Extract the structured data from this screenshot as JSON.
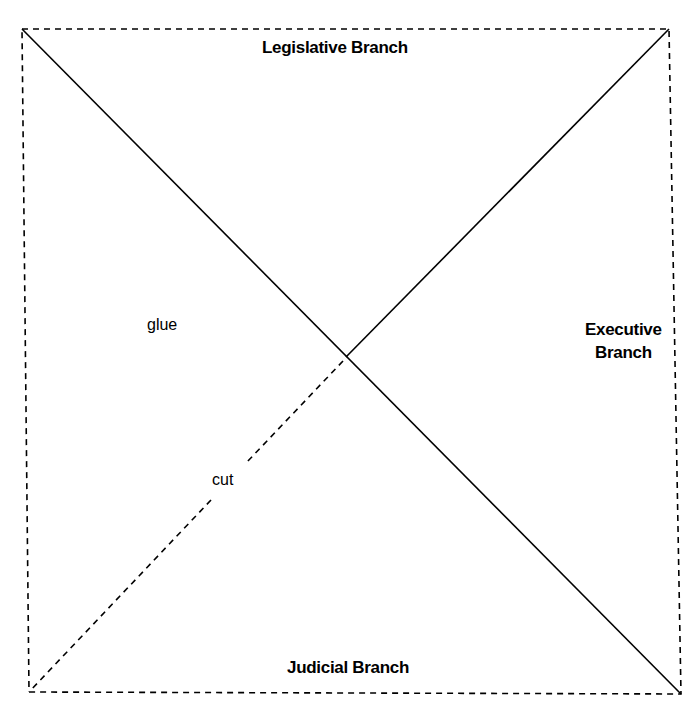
{
  "diagram": {
    "type": "cut-and-fold template",
    "labels": {
      "top": "Legislative Branch",
      "right_line1": "Executive",
      "right_line2": "Branch",
      "bottom": "Judicial Branch",
      "glue": "glue",
      "cut": "cut"
    },
    "square_corners": {
      "top_left": [
        22,
        29
      ],
      "top_right": [
        669,
        29
      ],
      "bottom_right": [
        681,
        694
      ],
      "bottom_left": [
        29,
        692
      ]
    },
    "center": [
      346,
      357
    ],
    "lines": {
      "border": "dashed",
      "diagonal_tl_to_br": "solid",
      "center_to_tr": "solid",
      "center_to_bl": "dashed (cut line)"
    },
    "colors": {
      "line": "#000000",
      "background": "#ffffff"
    }
  }
}
